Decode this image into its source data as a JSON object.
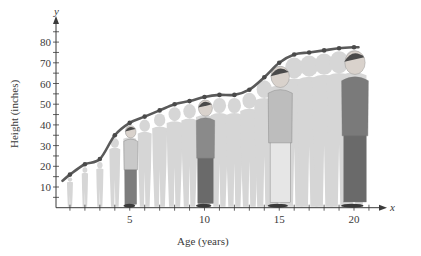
{
  "chart_data": {
    "type": "line",
    "title": "",
    "xlabel": "Age (years)",
    "ylabel": "Height (inches)",
    "x_axis_var": "x",
    "y_axis_var": "y",
    "x_ticks": [
      "5",
      "10",
      "15",
      "20"
    ],
    "y_ticks": [
      "10",
      "20",
      "30",
      "40",
      "50",
      "60",
      "70",
      "80"
    ],
    "xlim": [
      0,
      21
    ],
    "ylim": [
      0,
      85
    ],
    "grid": false,
    "legend": null,
    "series": [
      {
        "name": "Height",
        "x": [
          0.5,
          1,
          2,
          3,
          4,
          5,
          6,
          7,
          8,
          9,
          10,
          11,
          12,
          13,
          14,
          15,
          16,
          17,
          18,
          19,
          20,
          20.3
        ],
        "values": [
          13,
          16,
          21,
          23.5,
          35,
          41,
          44,
          47,
          50,
          51.5,
          53.5,
          54.5,
          54.5,
          57,
          63,
          70,
          74,
          75,
          76,
          77,
          77.5,
          77.5
        ],
        "marker_x": [
          1,
          2,
          3,
          4,
          5,
          6,
          7,
          8,
          9,
          10,
          11,
          12,
          13,
          14,
          15,
          16,
          17,
          18,
          19,
          20
        ],
        "color": "#5a5a5a"
      }
    ],
    "annotations": "Silhouettes of a person at each age from 1 to 20; highlighted figures at ages 5, 10, 15, 20"
  },
  "colors": {
    "axis": "#3a3a3a",
    "curve": "#5a5a5a",
    "silhouette": "#d6d6d6",
    "figure_dark": "#6e6e6e",
    "figure_mid": "#9a9a9a"
  }
}
